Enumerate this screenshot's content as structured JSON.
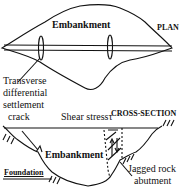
{
  "plan": {
    "title": "PLAN",
    "embankment_label": "Embankment",
    "crack_label_lines": [
      "Transverse",
      "differential",
      "settlement",
      "crack"
    ]
  },
  "section": {
    "title": "CROSS-SECTION",
    "shear_label": "Shear stress",
    "shear_symbol": "τ",
    "embankment_label": "Embankment",
    "foundation_label": "Foundation",
    "abutment_label_lines": [
      "Jagged rock",
      "abutment"
    ]
  },
  "colors": {
    "line": "#111111",
    "background": "#ffffff"
  }
}
